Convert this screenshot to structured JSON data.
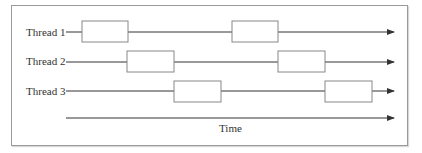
{
  "diagram": {
    "threads": [
      {
        "label": "Thread 1",
        "y": 32,
        "boxes": [
          {
            "x1": 82,
            "x2": 128
          },
          {
            "x1": 232,
            "x2": 278
          }
        ]
      },
      {
        "label": "Thread 2",
        "y": 61,
        "boxes": [
          {
            "x1": 127,
            "x2": 174
          },
          {
            "x1": 278,
            "x2": 325
          }
        ]
      },
      {
        "label": "Thread 3",
        "y": 91,
        "boxes": [
          {
            "x1": 174,
            "x2": 221
          },
          {
            "x1": 325,
            "x2": 372
          }
        ]
      }
    ],
    "time_axis": {
      "label": "Time",
      "y": 118
    },
    "line_start_x": 66,
    "arrow_tip_x": 394,
    "colors": {
      "line": "#333333",
      "box_border": "#888888",
      "frame_border": "#9a9a9a",
      "text": "#333333"
    }
  }
}
